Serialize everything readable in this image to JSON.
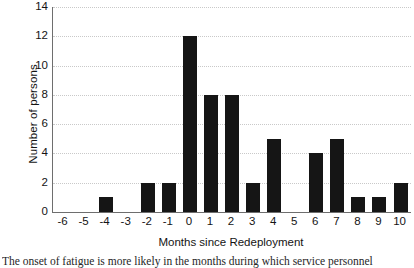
{
  "chart_data": {
    "type": "bar",
    "title": "",
    "xlabel": "Months since Redeployment",
    "ylabel": "Number of persons",
    "categories": [
      "-6",
      "-5",
      "-4",
      "-3",
      "-2",
      "-1",
      "0",
      "1",
      "2",
      "3",
      "4",
      "5",
      "6",
      "7",
      "8",
      "9",
      "10"
    ],
    "values": [
      0,
      0,
      1,
      0,
      2,
      2,
      12,
      8,
      8,
      2,
      5,
      0,
      4,
      5,
      1,
      1,
      2
    ],
    "ylim": [
      0,
      14
    ],
    "yticks": [
      0,
      2,
      4,
      6,
      8,
      10,
      12,
      14
    ],
    "grid": "horizontal-dotted",
    "legend": "none",
    "bar_color": "#151515",
    "gridline_color": "#c9c9c9",
    "axis_color": "#6e6e6e"
  },
  "caption": {
    "text": "The onset of fatigue is more likely in the months during which service personnel"
  }
}
